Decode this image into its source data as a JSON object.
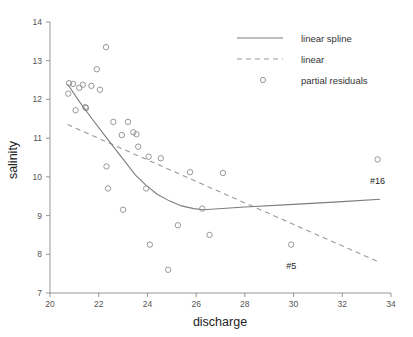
{
  "chart_data": {
    "type": "scatter",
    "title": "",
    "subtitle": "",
    "xlabel": "discharge",
    "ylabel": "salinity",
    "xlim": [
      20,
      34
    ],
    "ylim": [
      7,
      14
    ],
    "xticks": [
      20,
      22,
      24,
      26,
      28,
      30,
      32,
      34
    ],
    "yticks": [
      7,
      8,
      9,
      10,
      11,
      12,
      13,
      14
    ],
    "xticklabels": [
      "20",
      "22",
      "24",
      "26",
      "28",
      "30",
      "32",
      "34"
    ],
    "yticklabels": [
      "7",
      "8",
      "9",
      "10",
      "11",
      "12",
      "13",
      "14"
    ],
    "grid": false,
    "legend_position": "top-right",
    "legend": [
      {
        "label": "linear spline",
        "marker": "solid-line",
        "color": "#7c7c7c"
      },
      {
        "label": "linear",
        "marker": "dashed-line",
        "color": "#9a9a9a"
      },
      {
        "label": "partial residuals",
        "marker": "open-circle",
        "color": "#8c8c8c"
      }
    ],
    "series": [
      {
        "name": "partial residuals",
        "type": "scatter",
        "marker": "open-circle",
        "points": [
          [
            20.75,
            12.15
          ],
          [
            20.78,
            12.42
          ],
          [
            20.95,
            12.4
          ],
          [
            21.05,
            11.72
          ],
          [
            21.2,
            12.3
          ],
          [
            21.35,
            12.38
          ],
          [
            21.45,
            11.8
          ],
          [
            21.48,
            11.78
          ],
          [
            21.7,
            12.35
          ],
          [
            21.92,
            12.78
          ],
          [
            22.05,
            12.25
          ],
          [
            22.3,
            13.35
          ],
          [
            22.32,
            10.27
          ],
          [
            22.38,
            9.7
          ],
          [
            22.6,
            11.42
          ],
          [
            22.95,
            11.08
          ],
          [
            23.0,
            9.15
          ],
          [
            23.2,
            11.42
          ],
          [
            23.42,
            11.15
          ],
          [
            23.55,
            11.1
          ],
          [
            23.62,
            10.78
          ],
          [
            23.95,
            9.7
          ],
          [
            24.05,
            10.52
          ],
          [
            24.1,
            8.25
          ],
          [
            24.55,
            10.48
          ],
          [
            24.85,
            7.6
          ],
          [
            25.25,
            8.75
          ],
          [
            25.75,
            10.12
          ],
          [
            26.25,
            9.18
          ],
          [
            26.55,
            8.5
          ],
          [
            27.1,
            10.1
          ],
          [
            29.9,
            8.25
          ],
          [
            33.45,
            10.45
          ]
        ]
      },
      {
        "name": "linear spline",
        "type": "line",
        "style": "solid",
        "points": [
          [
            20.72,
            12.4
          ],
          [
            21.2,
            11.95
          ],
          [
            21.7,
            11.52
          ],
          [
            22.15,
            11.15
          ],
          [
            22.6,
            10.78
          ],
          [
            23.05,
            10.42
          ],
          [
            23.5,
            10.05
          ],
          [
            23.95,
            9.78
          ],
          [
            24.4,
            9.55
          ],
          [
            24.9,
            9.38
          ],
          [
            25.4,
            9.25
          ],
          [
            25.9,
            9.18
          ],
          [
            26.3,
            9.15
          ],
          [
            28.0,
            9.22
          ],
          [
            30.0,
            9.29
          ],
          [
            32.0,
            9.36
          ],
          [
            33.55,
            9.42
          ]
        ]
      },
      {
        "name": "linear",
        "type": "line",
        "style": "dashed",
        "points": [
          [
            20.72,
            11.35
          ],
          [
            33.5,
            7.8
          ]
        ]
      }
    ],
    "annotations": [
      {
        "text": "#16",
        "x": 33.45,
        "y": 10.13,
        "target_point": [
          33.45,
          10.45
        ]
      },
      {
        "text": "#5",
        "x": 29.9,
        "y": 7.93,
        "target_point": [
          29.9,
          8.25
        ]
      }
    ]
  }
}
